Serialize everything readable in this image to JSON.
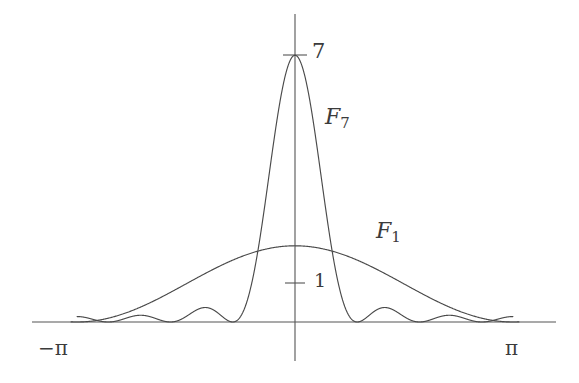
{
  "figure": {
    "width": 579,
    "height": 383,
    "background_color": "#ffffff",
    "line_color": "#4a4a4a",
    "axis_color": "#555555",
    "text_color": "#3b3b3b"
  },
  "labels": {
    "peak_value": "7",
    "one_value": "1",
    "curve_f7_name": "F",
    "curve_f7_index": "7",
    "curve_f1_name": "F",
    "curve_f1_index": "1",
    "x_min_tick": "−π",
    "x_max_tick": "π"
  },
  "chart_data": {
    "type": "line",
    "title": "",
    "xlabel": "",
    "ylabel": "",
    "xlim": [
      -3.141592653589793,
      3.141592653589793
    ],
    "ylim": [
      0,
      7.6
    ],
    "xticks": [
      -3.141592653589793,
      3.141592653589793
    ],
    "xticklabels": [
      "−π",
      "π"
    ],
    "yticks": [
      1,
      7
    ],
    "yticklabels": [
      "1",
      "7"
    ],
    "grid": false,
    "legend": "inline-annotations",
    "annotations": [
      {
        "text": "F_7",
        "x": 0.48,
        "y": 5.1
      },
      {
        "text": "F_1",
        "x": 1.12,
        "y": 2.6
      },
      {
        "text": "7",
        "x": 0.08,
        "y": 7.0
      },
      {
        "text": "1",
        "x": 0.12,
        "y": 1.0
      }
    ],
    "series": [
      {
        "name": "F_7",
        "formula": "F_7(t) = (1/7) * ( sin(7t/2) / sin(t/2) )^2",
        "peak_value": 7,
        "peak_x": 0,
        "first_zeros_x": [
          -0.8975979010256552,
          0.8975979010256552
        ],
        "n": 7,
        "samples_x": [
          -3.1416,
          -3.0,
          -2.8,
          -2.6,
          -2.4,
          -2.2,
          -2.0,
          -1.8,
          -1.6,
          -1.4,
          -1.2,
          -1.0,
          -0.8,
          -0.6,
          -0.4,
          -0.2,
          0.0,
          0.2,
          0.4,
          0.6,
          0.8,
          1.0,
          1.2,
          1.4,
          1.6,
          1.8,
          2.0,
          2.2,
          2.4,
          2.6,
          2.8,
          3.0,
          3.1416
        ],
        "samples_y": [
          0.143,
          0.167,
          0.392,
          0.041,
          0.031,
          0.512,
          0.383,
          0.0,
          0.506,
          0.659,
          0.018,
          0.398,
          0.983,
          2.47,
          4.78,
          6.5,
          7.0,
          6.5,
          4.78,
          2.47,
          0.983,
          0.398,
          0.018,
          0.659,
          0.506,
          0.0,
          0.383,
          0.512,
          0.031,
          0.041,
          0.392,
          0.167,
          0.143
        ]
      },
      {
        "name": "F_1",
        "formula": "F_1 envelope: peaks near 2 at t = 0, decays to 0 at t = ±π",
        "peak_value": 2,
        "peak_x": 0,
        "n": 1,
        "samples_x": [
          -3.1416,
          -3.0,
          -2.8,
          -2.6,
          -2.4,
          -2.2,
          -2.0,
          -1.8,
          -1.6,
          -1.4,
          -1.2,
          -1.0,
          -0.8,
          -0.6,
          -0.4,
          -0.2,
          0.0,
          0.2,
          0.4,
          0.6,
          0.8,
          1.0,
          1.2,
          1.4,
          1.6,
          1.8,
          2.0,
          2.2,
          2.4,
          2.6,
          2.8,
          3.0,
          3.1416
        ],
        "samples_y": [
          0.0,
          0.02,
          0.08,
          0.18,
          0.32,
          0.49,
          0.68,
          0.89,
          1.1,
          1.3,
          1.49,
          1.65,
          1.78,
          1.88,
          1.95,
          1.99,
          2.0,
          1.99,
          1.95,
          1.88,
          1.78,
          1.65,
          1.49,
          1.3,
          1.1,
          0.89,
          0.68,
          0.49,
          0.32,
          0.18,
          0.08,
          0.02,
          0.0
        ]
      }
    ]
  }
}
